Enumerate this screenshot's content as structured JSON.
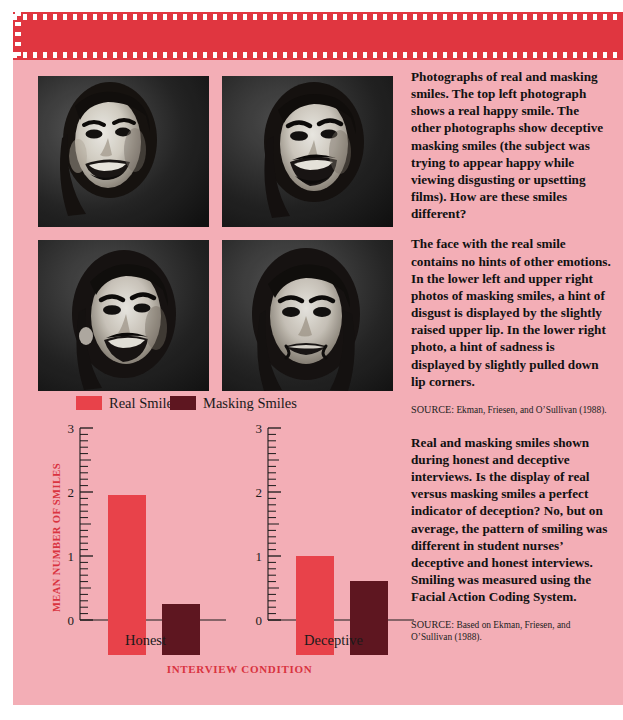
{
  "colors": {
    "band": "#e03640",
    "panel": "#f3aeb6",
    "real_smiles": "#e8424a",
    "masking_smiles": "#5e1620",
    "accent_text": "#d9333f"
  },
  "photos": [
    {
      "name": "top-left-real-happy-smile",
      "alt": "Woman smiling, real happy smile, three-quarter view"
    },
    {
      "name": "top-right-masking-smile",
      "alt": "Woman masking smile, hint of disgust, raised upper lip"
    },
    {
      "name": "bottom-left-masking-smile",
      "alt": "Woman masking smile, hint of disgust, raised upper lip"
    },
    {
      "name": "bottom-right-masking-smile",
      "alt": "Woman masking smile, hint of sadness, pulled down lip corners"
    }
  ],
  "legend": {
    "items": [
      {
        "label": "Real Smiles",
        "color": "#e8424a"
      },
      {
        "label": "Masking Smiles",
        "color": "#5e1620"
      }
    ]
  },
  "chart_data": {
    "type": "bar",
    "title": "",
    "xlabel": "INTERVIEW CONDITION",
    "ylabel": "MEAN NUMBER OF SMILES",
    "categories": [
      "Honest",
      "Deceptive"
    ],
    "ylim": [
      0,
      3
    ],
    "yticks": [
      0,
      1,
      2,
      3
    ],
    "ytick_labels": [
      "0",
      "1",
      "2",
      "3"
    ],
    "minor_tick_interval": 0.1,
    "major_tick_interval": 0.5,
    "grid": false,
    "legend_position": "above-plot",
    "series": [
      {
        "name": "Real Smiles",
        "color": "#e8424a",
        "values": [
          2.5,
          1.55
        ]
      },
      {
        "name": "Masking Smiles",
        "color": "#5e1620",
        "values": [
          0.8,
          1.15
        ]
      }
    ]
  },
  "captions": {
    "photo_caption": "Photographs of real and masking smiles. The top left photograph shows a real happy smile. The other photographs show deceptive masking smiles (the subject was trying to appear happy while viewing disgusting or upsetting films). How are these smiles different?",
    "analysis_caption": "The face with the real smile contains no hints of other emotions. In the lower left and upper right photos of masking smiles, a hint of disgust is displayed by the slightly raised upper lip. In the lower right photo, a hint of sadness is displayed by slightly pulled down lip corners.",
    "chart_caption": "Real and masking smiles shown during honest and deceptive interviews. Is the display of real versus masking smiles a perfect indicator of deception? No, but on average, the pattern of smiling was different in student nurses’ deceptive and honest interviews. Smiling was measured using the Facial Action Coding System."
  },
  "sources": {
    "label": "SOURCE:",
    "photo_source_text": " Ekman, Friesen, and O’Sullivan (1988).",
    "chart_source_text": " Based on Ekman, Friesen, and O’Sullivan (1988)."
  }
}
